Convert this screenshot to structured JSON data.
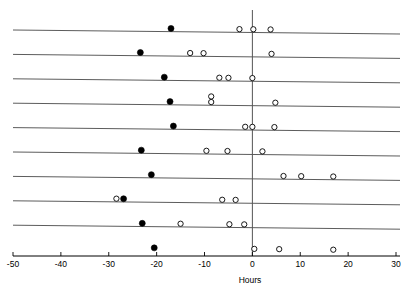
{
  "chart_data": {
    "type": "scatter",
    "title": "",
    "xlabel": "Hours",
    "ylabel": "",
    "xlim": [
      -50,
      30
    ],
    "ylim": [
      0,
      11
    ],
    "grid": false,
    "legend": null,
    "xticks": [
      -50,
      -40,
      -30,
      -20,
      -10,
      0,
      10,
      20,
      30
    ],
    "xticklabels": [
      "-50",
      "-40",
      "-30",
      "-20",
      "-10",
      "0",
      "10",
      "20",
      "30"
    ],
    "zero_line": 0,
    "marker_styles": {
      "filled": "solid black circle",
      "open": "hollow black-outlined circle"
    },
    "rows": [
      {
        "row": 1,
        "y": 10,
        "filled": [
          -17.0
        ],
        "open": [
          -2.7,
          0.2,
          3.8
        ]
      },
      {
        "row": 2,
        "y": 9,
        "filled": [
          -23.4
        ],
        "open": [
          -13.0,
          -10.2,
          4.0
        ]
      },
      {
        "row": 3,
        "y": 8,
        "filled": [
          -18.4
        ],
        "open": [
          -6.9,
          -5.0,
          0.0
        ]
      },
      {
        "row": 4,
        "y": 7,
        "filled": [
          -17.2
        ],
        "open": [
          -8.6,
          -8.6,
          4.8
        ]
      },
      {
        "row": 5,
        "y": 6,
        "filled": [
          -16.5
        ],
        "open": [
          -1.5,
          0.0,
          4.6
        ]
      },
      {
        "row": 6,
        "y": 5,
        "filled": [
          -23.2
        ],
        "open": [
          -9.6,
          -5.2,
          2.1
        ]
      },
      {
        "row": 7,
        "y": 4,
        "filled": [
          -21.1
        ],
        "open": [
          6.5,
          10.2,
          16.9
        ]
      },
      {
        "row": 8,
        "y": 3,
        "filled": [
          -26.9
        ],
        "open": [
          -28.4,
          -6.3,
          -3.5
        ]
      },
      {
        "row": 9,
        "y": 2,
        "filled": [
          -23.0
        ],
        "open": [
          -15.0,
          -4.8,
          -1.7
        ]
      },
      {
        "row": 10,
        "y": 1,
        "filled": [
          -20.5
        ],
        "open": [
          0.4,
          5.6,
          16.9
        ]
      }
    ]
  },
  "axis": {
    "xlabel": "Hours",
    "tick_0": "0",
    "tick_10": "10",
    "tick_20": "20",
    "tick_30": "30",
    "tick_m10": "-10",
    "tick_m20": "-20",
    "tick_m30": "-30",
    "tick_m40": "-40",
    "tick_m50": "-50"
  }
}
